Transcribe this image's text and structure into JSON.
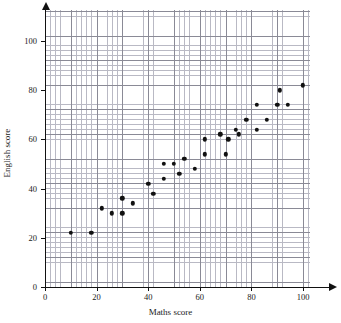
{
  "chart_data": {
    "type": "scatter",
    "title": "",
    "xlabel": "Maths score",
    "ylabel": "English score",
    "xlim": [
      0,
      110
    ],
    "ylim": [
      0,
      110
    ],
    "xticks": [
      0,
      20,
      40,
      60,
      80,
      100
    ],
    "yticks": [
      0,
      20,
      40,
      60,
      80,
      100
    ],
    "xtick_labels": [
      "0",
      "20",
      "40",
      "60",
      "80",
      "100"
    ],
    "ytick_labels": [
      "0",
      "20",
      "40",
      "60",
      "80",
      "100"
    ],
    "grid": true,
    "grid_minor_step": 2,
    "grid_major_step": 10,
    "legend": "none",
    "marker": "filled-circle",
    "marker_color": "#111111",
    "points": [
      {
        "x": 10,
        "y": 22
      },
      {
        "x": 18,
        "y": 22
      },
      {
        "x": 22,
        "y": 32
      },
      {
        "x": 26,
        "y": 30
      },
      {
        "x": 30,
        "y": 30
      },
      {
        "x": 30,
        "y": 36
      },
      {
        "x": 34,
        "y": 34
      },
      {
        "x": 40,
        "y": 42
      },
      {
        "x": 42,
        "y": 38
      },
      {
        "x": 46,
        "y": 44
      },
      {
        "x": 46,
        "y": 50
      },
      {
        "x": 50,
        "y": 50
      },
      {
        "x": 52,
        "y": 46
      },
      {
        "x": 54,
        "y": 52
      },
      {
        "x": 58,
        "y": 48
      },
      {
        "x": 62,
        "y": 54
      },
      {
        "x": 62,
        "y": 60
      },
      {
        "x": 68,
        "y": 62
      },
      {
        "x": 70,
        "y": 54
      },
      {
        "x": 71,
        "y": 60
      },
      {
        "x": 74,
        "y": 64
      },
      {
        "x": 75,
        "y": 62
      },
      {
        "x": 78,
        "y": 68
      },
      {
        "x": 82,
        "y": 64
      },
      {
        "x": 82,
        "y": 74
      },
      {
        "x": 86,
        "y": 68
      },
      {
        "x": 90,
        "y": 74
      },
      {
        "x": 91,
        "y": 80
      },
      {
        "x": 94,
        "y": 74
      },
      {
        "x": 100,
        "y": 82
      }
    ]
  }
}
